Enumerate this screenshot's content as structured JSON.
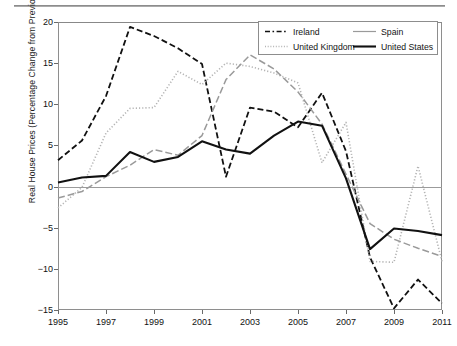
{
  "chart_data": {
    "type": "line",
    "title": "",
    "xlabel": "",
    "ylabel": "Real House Prices (Percentage Change from Previous Year)",
    "x": [
      1995,
      1996,
      1997,
      1998,
      1999,
      2000,
      2001,
      2002,
      2003,
      2004,
      2005,
      2006,
      2007,
      2008,
      2009,
      2010,
      2011
    ],
    "xlim": [
      1995,
      2011
    ],
    "ylim": [
      -15,
      20
    ],
    "yticks": [
      20,
      15,
      10,
      5,
      0,
      -5,
      -10,
      -15
    ],
    "xticks": [
      1995,
      1997,
      1999,
      2001,
      2003,
      2005,
      2007,
      2009,
      2011
    ],
    "grid": false,
    "legend_position": "top-right",
    "series": [
      {
        "name": "Ireland",
        "style": "dashed",
        "color": "#111111",
        "values": [
          3.2,
          5.6,
          11.0,
          19.4,
          18.3,
          16.8,
          14.9,
          1.2,
          9.6,
          9.1,
          7.2,
          11.4,
          4.3,
          -8.6,
          -14.8,
          -11.3,
          -14.2
        ]
      },
      {
        "name": "United Kingdom",
        "style": "dotted",
        "color": "#b4b4b4",
        "values": [
          -2.6,
          -0.1,
          6.5,
          9.5,
          9.6,
          14.0,
          12.4,
          15.0,
          14.6,
          13.8,
          12.6,
          2.9,
          7.8,
          -9.1,
          -9.2,
          2.5,
          -9.1
        ]
      },
      {
        "name": "Spain",
        "style": "dash-dot",
        "color": "#9a9a9a",
        "values": [
          -1.4,
          -0.6,
          1.2,
          2.6,
          4.5,
          3.8,
          6.2,
          13.0,
          16.0,
          14.3,
          11.5,
          7.6,
          1.5,
          -4.5,
          -6.4,
          -7.5,
          -8.5
        ]
      },
      {
        "name": "United States",
        "style": "solid",
        "color": "#111111",
        "values": [
          0.5,
          1.1,
          1.3,
          4.2,
          3.0,
          3.6,
          5.5,
          4.5,
          4.0,
          6.2,
          7.9,
          7.4,
          1.0,
          -7.6,
          -5.1,
          -5.4,
          -5.9
        ]
      }
    ]
  },
  "legend": {
    "entries": [
      {
        "label": "Ireland",
        "sample": "dashed-line-sample"
      },
      {
        "label": "Spain",
        "sample": "solid-thin-line-sample"
      },
      {
        "label": "United Kingdom",
        "sample": "dotted-line-sample"
      },
      {
        "label": "United States",
        "sample": "solid-thick-line-sample"
      }
    ]
  }
}
